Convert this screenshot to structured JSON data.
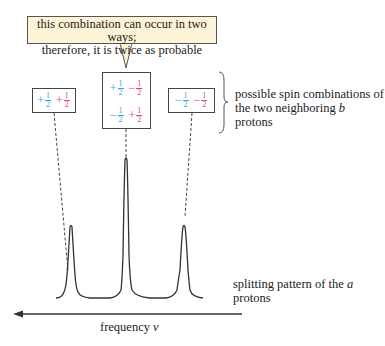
{
  "callout": {
    "line1": "this combination can occur in two ways;",
    "line2": "therefore, it is twice as probable",
    "background": "#fdf3d6"
  },
  "spin_boxes": [
    {
      "id": "left",
      "rows": [
        [
          {
            "sign": "+",
            "num": "1",
            "den": "2",
            "color": "cyan"
          },
          {
            "sign": "+",
            "num": "1",
            "den": "2",
            "color": "pink"
          }
        ]
      ]
    },
    {
      "id": "center",
      "rows": [
        [
          {
            "sign": "+",
            "num": "1",
            "den": "2",
            "color": "cyan"
          },
          {
            "sign": "−",
            "num": "1",
            "den": "2",
            "color": "pink"
          }
        ],
        [
          {
            "sign": "−",
            "num": "1",
            "den": "2",
            "color": "cyan"
          },
          {
            "sign": "+",
            "num": "1",
            "den": "2",
            "color": "pink"
          }
        ]
      ]
    },
    {
      "id": "right",
      "rows": [
        [
          {
            "sign": "−",
            "num": "1",
            "den": "2",
            "color": "cyan"
          },
          {
            "sign": "−",
            "num": "1",
            "den": "2",
            "color": "pink"
          }
        ]
      ]
    }
  ],
  "labels": {
    "spin_line1": "possible spin combinations of",
    "spin_line2_pre": "the two neighboring ",
    "spin_line2_italic": "b",
    "spin_line2_post": " protons",
    "splitting_pre": "splitting pattern of the ",
    "splitting_italic": "a",
    "splitting_post": " protons",
    "axis_pre": "frequency ",
    "axis_italic": "ν"
  },
  "colors": {
    "cyan": "#3aa6d8",
    "pink": "#e0457b",
    "line": "#333333"
  },
  "spectrum": {
    "peaks": [
      {
        "x": 71,
        "relative_height": 1
      },
      {
        "x": 126,
        "relative_height": 2
      },
      {
        "x": 184,
        "relative_height": 1
      }
    ],
    "ratio": "1:2:1"
  }
}
